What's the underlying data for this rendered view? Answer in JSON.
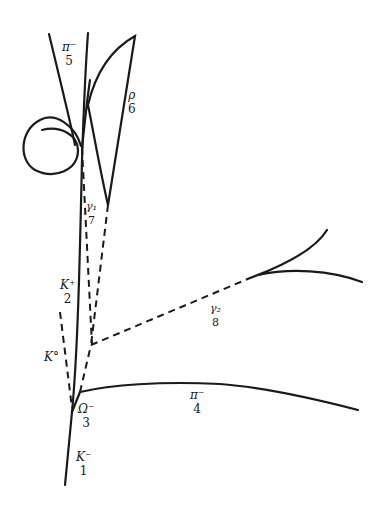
{
  "diagram": {
    "line_color": "#1a1a1a",
    "background": "#ffffff",
    "tracks": [
      {
        "id": 1,
        "particle": "K⁻",
        "number": "1",
        "type": "charged"
      },
      {
        "id": 2,
        "particle": "K⁺",
        "number": "2",
        "type": "charged"
      },
      {
        "id": 3,
        "particle": "Ω⁻",
        "number": "3",
        "type": "charged"
      },
      {
        "id": 4,
        "particle": "π⁻",
        "number": "4",
        "type": "charged"
      },
      {
        "id": 5,
        "particle": "π⁻",
        "number": "5",
        "type": "charged"
      },
      {
        "id": 6,
        "particle": "ρ",
        "number": "6",
        "type": "charged"
      },
      {
        "id": 7,
        "particle": "γ₁",
        "number": "7",
        "type": "neutral"
      },
      {
        "id": 8,
        "particle": "γ₂",
        "number": "8",
        "type": "neutral"
      },
      {
        "id": 9,
        "particle": "K°",
        "number": "",
        "type": "neutral"
      }
    ]
  }
}
